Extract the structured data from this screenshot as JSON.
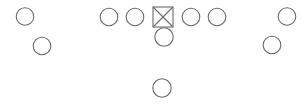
{
  "diagram": {
    "background_color": "#ffffff",
    "stroke_color": "#6b6b73",
    "width": 306,
    "height": 105,
    "legend": {
      "circle_meaning": "offensive player",
      "crossed_square_meaning": "center / ball carrier"
    },
    "players": [
      {
        "id": "split-end-left",
        "label": "Split End Left",
        "shape": "circle",
        "cx": 25,
        "cy": 16.5,
        "r": 8.8
      },
      {
        "id": "wingback-left",
        "label": "Wingback Left",
        "shape": "circle",
        "cx": 42,
        "cy": 46,
        "r": 8.8
      },
      {
        "id": "left-tackle",
        "label": "Left Tackle",
        "shape": "circle",
        "cx": 109,
        "cy": 17,
        "r": 8.8
      },
      {
        "id": "left-guard",
        "label": "Left Guard",
        "shape": "circle",
        "cx": 135,
        "cy": 17,
        "r": 8.8
      },
      {
        "id": "center",
        "label": "Center",
        "shape": "crossed-square",
        "cx": 163,
        "cy": 17,
        "size": 20
      },
      {
        "id": "right-guard",
        "label": "Right Guard",
        "shape": "circle",
        "cx": 191,
        "cy": 17,
        "r": 8.8
      },
      {
        "id": "right-tackle",
        "label": "Right Tackle",
        "shape": "circle",
        "cx": 217,
        "cy": 17,
        "r": 8.8
      },
      {
        "id": "quarterback",
        "label": "Quarterback",
        "shape": "circle",
        "cx": 164,
        "cy": 37,
        "r": 9.2
      },
      {
        "id": "split-end-right",
        "label": "Split End Right",
        "shape": "circle",
        "cx": 287,
        "cy": 16.5,
        "r": 8.8
      },
      {
        "id": "wingback-right",
        "label": "Wingback Right",
        "shape": "circle",
        "cx": 272,
        "cy": 45,
        "r": 8.8
      },
      {
        "id": "tailback",
        "label": "Tailback",
        "shape": "circle",
        "cx": 162,
        "cy": 88,
        "r": 9.2
      }
    ]
  }
}
